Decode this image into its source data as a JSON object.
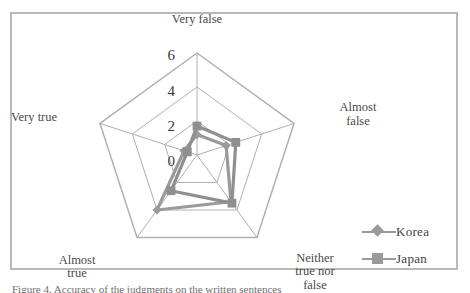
{
  "figure": {
    "frame_border_color": "#b9b9b9",
    "background": "#ffffff",
    "caption": "Figure 4. Accuracy of the judgments on the written sentences"
  },
  "legend": {
    "position": "right-bottom",
    "entries": [
      {
        "label": "Korea",
        "marker": "diamond",
        "color": "#9a9a9a",
        "icon": "diamond-marker-icon"
      },
      {
        "label": "Japan",
        "marker": "square",
        "color": "#9a9a9a",
        "icon": "square-marker-icon"
      }
    ]
  },
  "axis_ticks": [
    "6",
    "4",
    "2",
    "0"
  ],
  "chart_data": {
    "type": "radar",
    "title": "",
    "subtitle": "",
    "xlabel": "",
    "ylabel": "",
    "categories": [
      "Very false",
      "Almost false",
      "Neither true nor false",
      "Almost true",
      "Very true"
    ],
    "category_lines": [
      [
        "Very false"
      ],
      [
        "Almost",
        "false"
      ],
      [
        "Neither",
        "true nor",
        "false"
      ],
      [
        "Almost",
        "true"
      ],
      [
        "Very true"
      ]
    ],
    "rlim": [
      0,
      6
    ],
    "rticks": [
      0,
      2,
      4,
      6
    ],
    "grid": true,
    "grid_color": "#b0b0b0",
    "legend_position": "right",
    "series": [
      {
        "name": "Korea",
        "color": "#9a9a9a",
        "marker": "diamond",
        "values": [
          1.2,
          1.8,
          3.4,
          4.0,
          0.8
        ]
      },
      {
        "name": "Japan",
        "color": "#8f8f8f",
        "marker": "square",
        "values": [
          1.7,
          2.4,
          3.5,
          2.6,
          0.6
        ]
      }
    ]
  }
}
